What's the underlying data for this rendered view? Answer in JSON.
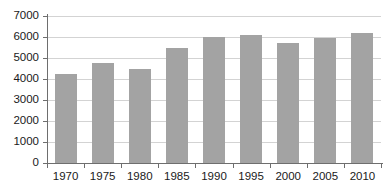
{
  "chart_data": {
    "type": "bar",
    "title": "",
    "subtitle": "",
    "xlabel": "",
    "ylabel": "",
    "categories": [
      "1970",
      "1975",
      "1980",
      "1985",
      "1990",
      "1995",
      "2000",
      "2005",
      "2010"
    ],
    "values": [
      4250,
      4760,
      4500,
      5480,
      5980,
      6080,
      5700,
      5950,
      6180
    ],
    "ylim": [
      0,
      7000
    ],
    "y_ticks": [
      0,
      1000,
      2000,
      3000,
      4000,
      5000,
      6000,
      7000
    ],
    "y_tick_labels": [
      "0",
      "1000",
      "2000",
      "3000",
      "4000",
      "5000",
      "6000",
      "7000"
    ],
    "x_tick_labels": [
      "1970",
      "1975",
      "1980",
      "1985",
      "1990",
      "1995",
      "2000",
      "2005",
      "2010"
    ],
    "grid": true,
    "grid_axis": "y",
    "legend": false,
    "legend_position": "none",
    "annotations": [],
    "series": [
      {
        "name": "",
        "values": [
          4250,
          4760,
          4500,
          5480,
          5980,
          6080,
          5700,
          5950,
          6180
        ]
      }
    ]
  },
  "style": {
    "bar_color": "#a3a3a3",
    "grid_color": "#d3d3d3",
    "axis_color": "#6e6e6e",
    "text_color": "#1a1a1a",
    "background": "#ffffff"
  }
}
